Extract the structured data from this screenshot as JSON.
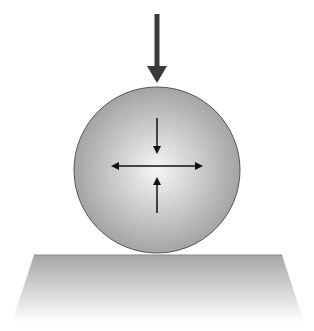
{
  "diagram": {
    "elements": {
      "applied_load_arrow": {
        "direction": "down",
        "x": 157,
        "y1": 14,
        "y2": 83,
        "color": "#3a3a3a"
      },
      "sphere": {
        "cx": 157,
        "cy": 170,
        "r": 83,
        "fill_center": "#f4f4f4",
        "fill_edge": "#a8a8a8",
        "stroke": "#555555"
      },
      "internal_arrows": {
        "top_down": {
          "x": 157,
          "y1": 118,
          "y2": 153
        },
        "bottom_up": {
          "x": 157,
          "y1": 213,
          "y2": 178
        },
        "horizontal_double": {
          "y": 166,
          "x1": 110,
          "x2": 202
        }
      },
      "surface": {
        "top_left": [
          34,
          255
        ],
        "top_right": [
          282,
          255
        ],
        "bottom_right": [
          304,
          322
        ],
        "bottom_left": [
          12,
          322
        ],
        "fill_top": "#a9a9a9",
        "fill_bottom": "#ffffff"
      }
    }
  }
}
